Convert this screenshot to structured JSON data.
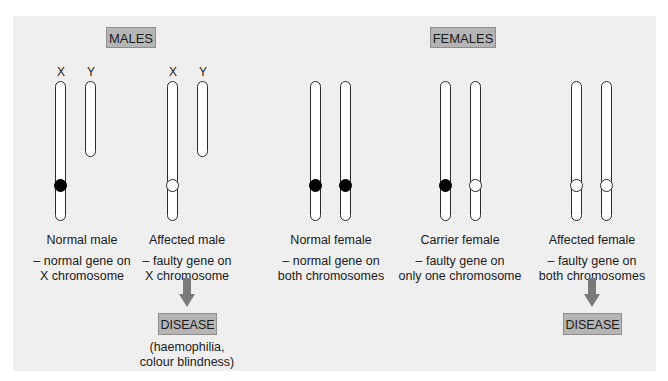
{
  "diagram": {
    "colors": {
      "panel_background": "#efefef",
      "tag_background": "#b5b5b5",
      "arrow": "#7a7a7a",
      "normal_gene": "#000000",
      "faulty_gene": "#ffffff"
    },
    "groups": {
      "males": {
        "label": "MALES"
      },
      "females": {
        "label": "FEMALES"
      }
    },
    "chromosome_letters": {
      "x": "X",
      "y": "Y"
    },
    "cases": [
      {
        "title": "Normal male",
        "description_line1": "– normal gene on",
        "description_line2": "X chromosome",
        "chromosomes": [
          {
            "type": "X",
            "gene": "normal"
          },
          {
            "type": "Y",
            "gene": "none"
          }
        ]
      },
      {
        "title": "Affected male",
        "description_line1": "– faulty gene on",
        "description_line2": "X chromosome",
        "chromosomes": [
          {
            "type": "X",
            "gene": "faulty"
          },
          {
            "type": "Y",
            "gene": "none"
          }
        ],
        "outcome": "DISEASE",
        "outcome_note_line1": "(haemophilia,",
        "outcome_note_line2": "colour blindness)"
      },
      {
        "title": "Normal female",
        "description_line1": "– normal gene on",
        "description_line2": "both chromosomes",
        "chromosomes": [
          {
            "type": "X",
            "gene": "normal"
          },
          {
            "type": "X",
            "gene": "normal"
          }
        ]
      },
      {
        "title": "Carrier female",
        "description_line1": "– faulty gene on",
        "description_line2": "only one chromosome",
        "chromosomes": [
          {
            "type": "X",
            "gene": "normal"
          },
          {
            "type": "X",
            "gene": "faulty"
          }
        ]
      },
      {
        "title": "Affected female",
        "description_line1": "– faulty gene on",
        "description_line2": "both chromosomes",
        "chromosomes": [
          {
            "type": "X",
            "gene": "faulty"
          },
          {
            "type": "X",
            "gene": "faulty"
          }
        ],
        "outcome": "DISEASE"
      }
    ]
  }
}
